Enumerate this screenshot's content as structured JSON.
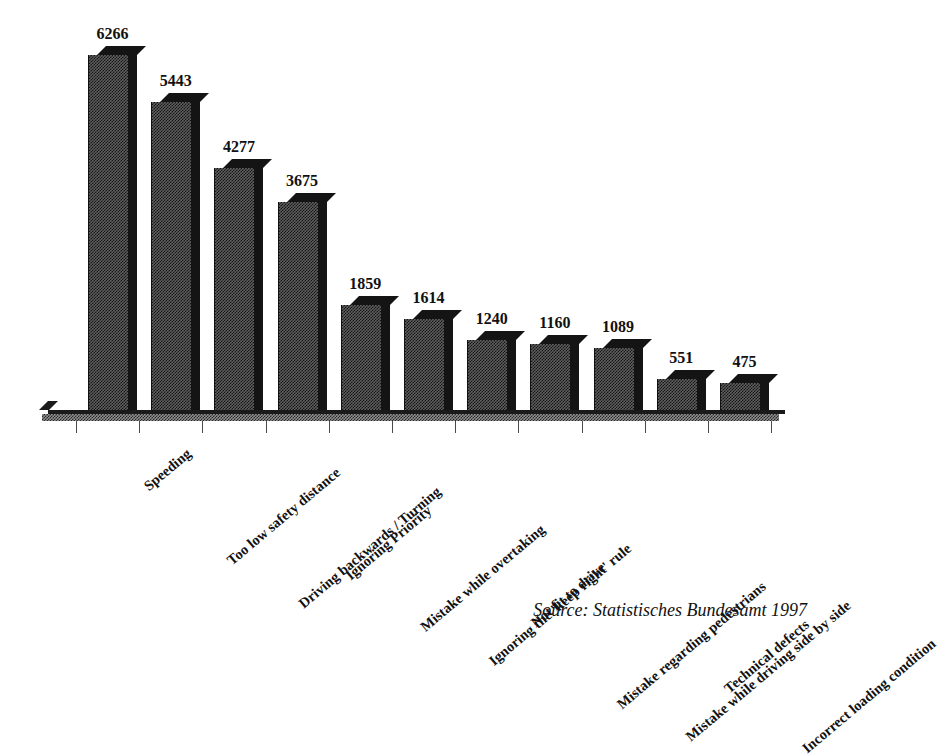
{
  "chart_data": {
    "type": "bar",
    "title": "",
    "subtitle": "",
    "xlabel": "",
    "ylabel": "",
    "ylim": [
      0,
      6266
    ],
    "grid": false,
    "legend": "none",
    "orientation": "vertical",
    "style": "3d-bar",
    "categories": [
      "Speeding",
      "Too low safety distance",
      "Driving backwards / Turning",
      "Ignoring Priority",
      "Mistake while overtaking",
      "Ignoring the 'keep right' rule",
      "Not fit to drive",
      "Mistake regarding pedestrians",
      "Mistake while driving side by side",
      "Technical defects",
      "Incorrect loading condition"
    ],
    "values": [
      6266,
      5443,
      4277,
      3675,
      1859,
      1614,
      1240,
      1160,
      1089,
      551,
      475
    ],
    "value_labels": [
      "6266",
      "5443",
      "4277",
      "3675",
      "1859",
      "1614",
      "1240",
      "1160",
      "1089",
      "551",
      "475"
    ],
    "annotations": [
      "Source: Statistisches Bundesamt 1997"
    ],
    "colors": {
      "bar_fill": "#5e5e5e",
      "bar_shadow": "#141414",
      "axis": "#1a1a1a",
      "text": "#111111",
      "background": "#ffffff"
    }
  },
  "source": {
    "text": "Source: Statistisches Bundesamt 1997"
  }
}
